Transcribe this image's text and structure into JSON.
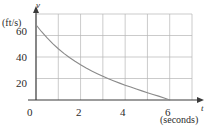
{
  "chart_data": {
    "type": "line",
    "title": "",
    "xlabel": "t",
    "xunit": "(seconds)",
    "ylabel": "v",
    "yunit": "(ft/s)",
    "xlim": [
      0,
      7
    ],
    "ylim": [
      0,
      80
    ],
    "grid": true,
    "grid_x_step": 1,
    "grid_y_step": 20,
    "legend": "none",
    "xticks": [
      {
        "value": 0,
        "label": "0"
      },
      {
        "value": 2,
        "label": "2"
      },
      {
        "value": 4,
        "label": "4"
      },
      {
        "value": 6,
        "label": "6"
      }
    ],
    "yticks": [
      {
        "value": 20,
        "label": "20"
      },
      {
        "value": 40,
        "label": "40"
      },
      {
        "value": 60,
        "label": "60"
      }
    ],
    "series": [
      {
        "name": "velocity",
        "color": "#8a8a8a",
        "x": [
          0.0,
          0.25,
          0.5,
          0.75,
          1.0,
          1.25,
          1.5,
          1.75,
          2.0,
          2.25,
          2.5,
          2.75,
          3.0,
          3.25,
          3.5,
          3.75,
          4.0,
          4.25,
          4.5,
          4.75,
          5.0,
          5.25,
          5.5,
          5.75,
          6.0
        ],
        "y": [
          70.0,
          63.5,
          57.7,
          52.4,
          47.7,
          43.4,
          39.5,
          36.0,
          32.8,
          29.8,
          27.0,
          24.5,
          22.1,
          19.8,
          17.7,
          15.7,
          13.8,
          12.0,
          10.2,
          8.5,
          6.8,
          5.2,
          3.6,
          1.9,
          0.0
        ]
      }
    ]
  },
  "axes": {
    "x_arrow": "arrowhead-right",
    "y_arrow": "arrowhead-up"
  },
  "colors": {
    "axis": "#3a3a3a",
    "grid": "#b5b5b5",
    "curve": "#8a8a8a",
    "text": "#2b2b2b",
    "background": "#ffffff"
  }
}
